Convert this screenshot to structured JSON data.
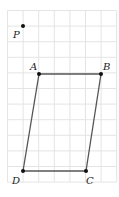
{
  "diagram": {
    "type": "parallelogram-on-grid",
    "grid": {
      "x0": 7.5,
      "y0": 10.5,
      "cell": 15.6,
      "cols": 7,
      "rows": 11,
      "color": "#e4e4e4"
    },
    "points": [
      {
        "name": "P",
        "label": "P",
        "x": 23,
        "y": 26,
        "label_dx": -10,
        "label_dy": 12
      },
      {
        "name": "A",
        "label": "A",
        "x": 39,
        "y": 74,
        "label_dx": -9,
        "label_dy": -4
      },
      {
        "name": "B",
        "label": "B",
        "x": 101,
        "y": 74,
        "label_dx": 2,
        "label_dy": -4
      },
      {
        "name": "C",
        "label": "C",
        "x": 86,
        "y": 171,
        "label_dx": 0,
        "label_dy": 13
      },
      {
        "name": "D",
        "label": "D",
        "x": 23,
        "y": 171,
        "label_dx": -11,
        "label_dy": 13
      }
    ],
    "segments": [
      [
        "A",
        "B"
      ],
      [
        "B",
        "C"
      ],
      [
        "C",
        "D"
      ],
      [
        "D",
        "A"
      ]
    ],
    "line_color": "#555555",
    "point_color": "#111111"
  }
}
